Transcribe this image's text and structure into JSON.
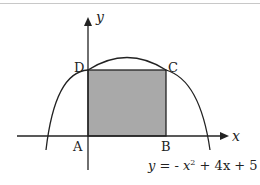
{
  "diagram": {
    "axes": {
      "x_label": "x",
      "y_label": "y"
    },
    "points": {
      "A": "A",
      "B": "B",
      "C": "C",
      "D": "D"
    },
    "equation": {
      "lhs": "y = - x",
      "exp": "2",
      "rhs": " + 4x + 5"
    },
    "colors": {
      "shade": "#a8a8a8",
      "stroke": "#222222"
    }
  }
}
